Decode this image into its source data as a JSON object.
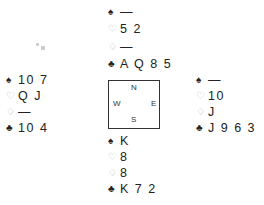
{
  "diagram": {
    "type": "bridge-deal",
    "suit_symbols": {
      "spades": "♠",
      "hearts": "♡",
      "diamonds": "♢",
      "clubs": "♣"
    },
    "compass": {
      "north": "N",
      "south": "S",
      "west": "W",
      "east": "E"
    },
    "hands": {
      "north": {
        "spades": "—",
        "hearts": "5 2",
        "diamonds": "—",
        "clubs": "A Q 8 5"
      },
      "west": {
        "spades": "10 7",
        "hearts": "Q J",
        "diamonds": "—",
        "clubs": "10 4"
      },
      "east": {
        "spades": "—",
        "hearts": "10",
        "diamonds": "J",
        "clubs": "J 9 6 3"
      },
      "south": {
        "spades": "K",
        "hearts": "8",
        "diamonds": "8",
        "clubs": "K 7 2"
      }
    },
    "colors": {
      "black_suit": "#222222",
      "red_suit_outline": "#b8b8b8",
      "border": "#333333"
    }
  }
}
